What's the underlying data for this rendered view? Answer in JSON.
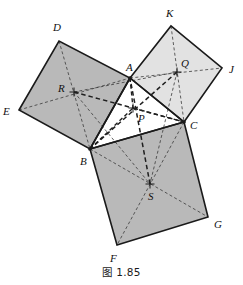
{
  "figure": {
    "caption": "图 1.85",
    "canvas": {
      "width": 243,
      "height": 285
    },
    "colors": {
      "square_left_fill": "#b9b9b9",
      "square_right_fill": "#e2e2e2",
      "square_bottom_fill": "#b9b9b9",
      "triangle_fill": "#ffffff",
      "outline": "#1a1a1a",
      "dashed": "#2b2b2b",
      "label": "#111111"
    },
    "points": {
      "A": {
        "x": 130,
        "y": 78,
        "label": "A",
        "lx": 126,
        "ly": 71
      },
      "B": {
        "x": 90,
        "y": 149,
        "label": "B",
        "lx": 80,
        "ly": 165
      },
      "C": {
        "x": 184,
        "y": 122,
        "label": "C",
        "lx": 190,
        "ly": 129
      },
      "D": {
        "x": 59,
        "y": 41,
        "label": "D",
        "lx": 53,
        "ly": 31
      },
      "E": {
        "x": 19,
        "y": 110,
        "label": "E",
        "lx": 3,
        "ly": 115
      },
      "F": {
        "x": 117,
        "y": 245,
        "label": "F",
        "lx": 110,
        "ly": 262
      },
      "G": {
        "x": 208,
        "y": 217,
        "label": "G",
        "lx": 214,
        "ly": 228
      },
      "J": {
        "x": 222,
        "y": 68,
        "label": "J",
        "lx": 229,
        "ly": 73
      },
      "K": {
        "x": 171,
        "y": 26,
        "label": "K",
        "lx": 166,
        "ly": 17
      },
      "P": {
        "x": 133,
        "y": 108,
        "label": "P",
        "lx": 138,
        "ly": 122
      },
      "Q": {
        "x": 177,
        "y": 72,
        "label": "Q",
        "lx": 181,
        "ly": 67
      },
      "R": {
        "x": 74,
        "y": 92,
        "label": "R",
        "lx": 58,
        "ly": 92
      },
      "S": {
        "x": 150,
        "y": 184,
        "label": "S",
        "lx": 148,
        "ly": 200
      }
    },
    "squares": [
      {
        "name": "square-on-AB",
        "vertices": [
          "E",
          "D",
          "A",
          "B"
        ],
        "center": "R",
        "shade": "dark"
      },
      {
        "name": "square-on-AC",
        "vertices": [
          "A",
          "K",
          "J",
          "C"
        ],
        "center": "Q",
        "shade": "light"
      },
      {
        "name": "square-on-BC",
        "vertices": [
          "B",
          "C",
          "G",
          "F"
        ],
        "center": "S",
        "shade": "dark"
      }
    ],
    "triangle": {
      "name": "triangle-ABC",
      "vertices": [
        "A",
        "B",
        "C"
      ]
    },
    "dashed_segments": [
      [
        "E",
        "A"
      ],
      [
        "D",
        "B"
      ],
      [
        "A",
        "J"
      ],
      [
        "K",
        "C"
      ],
      [
        "B",
        "G"
      ],
      [
        "C",
        "F"
      ],
      [
        "A",
        "P"
      ],
      [
        "B",
        "P"
      ],
      [
        "C",
        "P"
      ],
      [
        "R",
        "P"
      ],
      [
        "Q",
        "P"
      ],
      [
        "S",
        "P"
      ],
      [
        "R",
        "Q"
      ],
      [
        "R",
        "S"
      ],
      [
        "Q",
        "S"
      ],
      [
        "R",
        "C"
      ],
      [
        "Q",
        "B"
      ],
      [
        "S",
        "A"
      ]
    ],
    "center_markers": [
      "P",
      "Q",
      "R",
      "S"
    ]
  }
}
